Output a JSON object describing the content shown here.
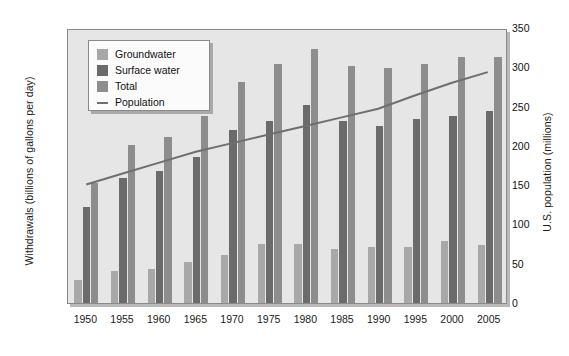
{
  "chart_data": {
    "type": "bar",
    "title": "",
    "subtitle": "",
    "xlabel": "",
    "ylabel": "Withdrawals (billions of gallons per day)",
    "y2label": "U.S. population (millions)",
    "categories": [
      "1950",
      "1955",
      "1960",
      "1965",
      "1970",
      "1975",
      "1980",
      "1985",
      "1990",
      "1995",
      "2000",
      "2005"
    ],
    "ylim": [
      0,
      400
    ],
    "y2lim": [
      0,
      350
    ],
    "yticks": [
      "0",
      "50",
      "100",
      "150",
      "200",
      "250",
      "300",
      "350",
      "400"
    ],
    "y2ticks": [
      "0",
      "50",
      "100",
      "150",
      "200",
      "250",
      "300",
      "350"
    ],
    "grid": false,
    "legend_position": "upper-left-inside",
    "series": [
      {
        "name": "Groundwater",
        "kind": "bar",
        "axis": "left",
        "color": "#a8a8a8",
        "values": [
          34,
          47,
          49,
          60,
          70,
          86,
          86,
          78,
          82,
          81,
          90,
          85
        ]
      },
      {
        "name": "Surface water",
        "kind": "bar",
        "axis": "left",
        "color": "#6b6b6b",
        "values": [
          140,
          182,
          192,
          212,
          252,
          265,
          288,
          265,
          258,
          268,
          272,
          280
        ]
      },
      {
        "name": "Total",
        "kind": "bar",
        "axis": "left",
        "color": "#8d8d8d",
        "values": [
          175,
          230,
          242,
          272,
          322,
          348,
          370,
          345,
          342,
          348,
          358,
          358
        ]
      },
      {
        "name": "Population",
        "kind": "line",
        "axis": "right",
        "color": "#6f6f6f",
        "values": [
          152,
          166,
          180,
          194,
          205,
          216,
          227,
          238,
          249,
          266,
          282,
          296
        ]
      }
    ]
  },
  "legend": {
    "items": [
      {
        "label": "Groundwater",
        "swatch": "bar",
        "color": "#a8a8a8"
      },
      {
        "label": "Surface water",
        "swatch": "bar",
        "color": "#6b6b6b"
      },
      {
        "label": "Total",
        "swatch": "bar",
        "color": "#8d8d8d"
      },
      {
        "label": "Population",
        "swatch": "line",
        "color": "#6f6f6f"
      }
    ]
  }
}
